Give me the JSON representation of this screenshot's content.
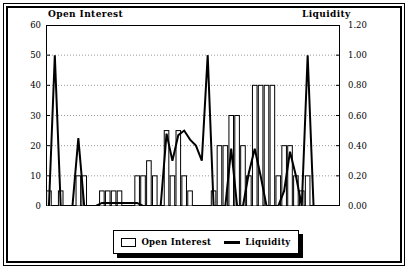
{
  "chart_data": {
    "type": "bar",
    "title": "",
    "left_axis_title": "Open Interest",
    "right_axis_title": "Liquidity",
    "xlabel": "",
    "ylabel": "Open Interest",
    "y2label": "Liquidity",
    "ylim": [
      0,
      60
    ],
    "y2lim": [
      0.0,
      1.2
    ],
    "yticks": [
      "0",
      "10",
      "20",
      "30",
      "40",
      "50",
      "60"
    ],
    "ytick_values": [
      0,
      10,
      20,
      30,
      40,
      50,
      60
    ],
    "y2ticks": [
      "0.00",
      "0.20",
      "0.40",
      "0.60",
      "0.80",
      "1.00",
      "1.20"
    ],
    "y2tick_values": [
      0.0,
      0.2,
      0.4,
      0.6,
      0.8,
      1.0,
      1.2
    ],
    "grid": true,
    "grid_style": "dotted-horizontal",
    "legend_position": "bottom-center",
    "x": [
      1,
      2,
      3,
      4,
      5,
      6,
      7,
      8,
      9,
      10,
      11,
      12,
      13,
      14,
      15,
      16,
      17,
      18,
      19,
      20,
      21,
      22,
      23,
      24,
      25,
      26,
      27,
      28,
      29,
      30,
      31,
      32,
      33,
      34,
      35,
      36,
      37,
      38,
      39,
      40,
      41,
      42,
      43,
      44,
      45,
      46,
      47,
      48,
      49,
      50
    ],
    "series": [
      {
        "name": "Open Interest",
        "type": "bar",
        "axis": "left",
        "color": "#ffffff",
        "edge_color": "#000000",
        "values": [
          5,
          0,
          5,
          0,
          0,
          10,
          10,
          0,
          0,
          5,
          5,
          5,
          5,
          0,
          0,
          10,
          10,
          15,
          10,
          0,
          25,
          10,
          25,
          10,
          5,
          0,
          0,
          0,
          5,
          20,
          20,
          30,
          30,
          20,
          10,
          40,
          40,
          40,
          40,
          10,
          20,
          20,
          10,
          5,
          10,
          0,
          0,
          0,
          0,
          0
        ]
      },
      {
        "name": "Liquidity",
        "type": "line",
        "axis": "right",
        "color": "#000000",
        "line_width": 2,
        "values": [
          0.0,
          1.0,
          0.0,
          0.0,
          0.0,
          0.45,
          0.0,
          0.0,
          0.0,
          0.02,
          0.02,
          0.02,
          0.02,
          0.02,
          0.02,
          0.02,
          0.0,
          0.0,
          0.0,
          0.0,
          0.48,
          0.3,
          0.47,
          0.5,
          0.44,
          0.4,
          0.3,
          1.0,
          0.0,
          0.0,
          0.0,
          0.38,
          0.0,
          0.0,
          0.22,
          0.38,
          0.2,
          0.0,
          0.0,
          0.0,
          0.1,
          0.36,
          0.2,
          0.0,
          1.0,
          0.0,
          0.0,
          0.0,
          0.0,
          0.0
        ]
      }
    ],
    "legend": [
      {
        "label": "Open Interest",
        "marker": "bar-swatch"
      },
      {
        "label": "Liquidity",
        "marker": "line-swatch"
      }
    ]
  }
}
